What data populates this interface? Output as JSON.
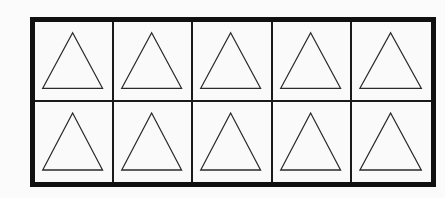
{
  "grid": {
    "rows": 2,
    "columns": 5,
    "border_color": "#111111",
    "divider_color": "#1a1a1a",
    "background": "#fafafa",
    "cells": [
      {
        "row": 1,
        "col": 1,
        "shape": "triangle-outline"
      },
      {
        "row": 1,
        "col": 2,
        "shape": "triangle-outline"
      },
      {
        "row": 1,
        "col": 3,
        "shape": "triangle-outline"
      },
      {
        "row": 1,
        "col": 4,
        "shape": "triangle-outline"
      },
      {
        "row": 1,
        "col": 5,
        "shape": "triangle-outline"
      },
      {
        "row": 2,
        "col": 1,
        "shape": "triangle-outline"
      },
      {
        "row": 2,
        "col": 2,
        "shape": "triangle-outline"
      },
      {
        "row": 2,
        "col": 3,
        "shape": "triangle-outline"
      },
      {
        "row": 2,
        "col": 4,
        "shape": "triangle-outline"
      },
      {
        "row": 2,
        "col": 5,
        "shape": "triangle-outline"
      }
    ],
    "shape_stroke": "#2a2a2a"
  }
}
